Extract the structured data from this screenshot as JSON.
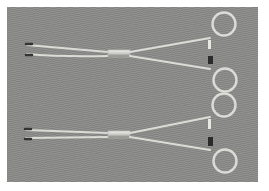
{
  "image": {
    "subject": "two surgical forceps",
    "background_color": "#8a8a88",
    "frame_color": "#ffffff",
    "instruments": [
      {
        "name": "upper-forceps",
        "ring_color": "#d8d8d4"
      },
      {
        "name": "lower-forceps",
        "ring_color": "#d8d8d4"
      }
    ]
  }
}
